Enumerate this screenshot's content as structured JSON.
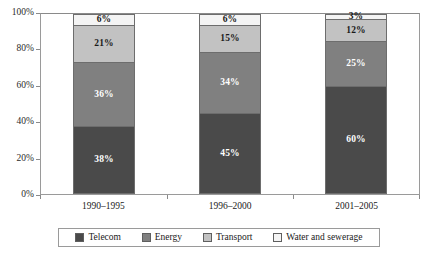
{
  "chart_data": {
    "type": "bar",
    "subtype": "100% stacked column",
    "title": "",
    "subtitle": "",
    "xlabel": "",
    "ylabel": "",
    "ylim": [
      0,
      100
    ],
    "ytick_values": [
      0,
      20,
      40,
      60,
      80,
      100
    ],
    "ytick_labels": [
      "0%",
      "20%",
      "40%",
      "60%",
      "80%",
      "100%"
    ],
    "grid": false,
    "legend_position": "bottom",
    "stack_order_bottom_to_top": [
      "Telecom",
      "Energy",
      "Transport",
      "Water and sewerage"
    ],
    "categories": [
      "1990–1995",
      "1996–2000",
      "2001–2005"
    ],
    "series": [
      {
        "name": "Telecom",
        "color": "#4a4a4a",
        "values": [
          38,
          45,
          60
        ],
        "labels": [
          "38%",
          "45%",
          "60%"
        ]
      },
      {
        "name": "Energy",
        "color": "#808080",
        "values": [
          36,
          34,
          25
        ],
        "labels": [
          "36%",
          "34%",
          "25%"
        ]
      },
      {
        "name": "Transport",
        "color": "#c2c2c2",
        "values": [
          21,
          15,
          12
        ],
        "labels": [
          "21%",
          "15%",
          "12%"
        ]
      },
      {
        "name": "Water and sewerage",
        "color": "#f4f4f4",
        "values": [
          6,
          6,
          3
        ],
        "labels": [
          "6%",
          "6%",
          "3%"
        ]
      }
    ]
  },
  "axis": {
    "y_ticks": [
      {
        "label": "100%",
        "value": 100
      },
      {
        "label": "80%",
        "value": 80
      },
      {
        "label": "60%",
        "value": 60
      },
      {
        "label": "40%",
        "value": 40
      },
      {
        "label": "20%",
        "value": 20
      },
      {
        "label": "0%",
        "value": 0
      }
    ],
    "x_categories": [
      "1990–1995",
      "1996–2000",
      "2001–2005"
    ]
  },
  "legend": {
    "items": [
      {
        "label": "Telecom",
        "color": "#4a4a4a"
      },
      {
        "label": "Energy",
        "color": "#808080"
      },
      {
        "label": "Transport",
        "color": "#c2c2c2"
      },
      {
        "label": "Water and sewerage",
        "color": "#f4f4f4"
      }
    ]
  }
}
